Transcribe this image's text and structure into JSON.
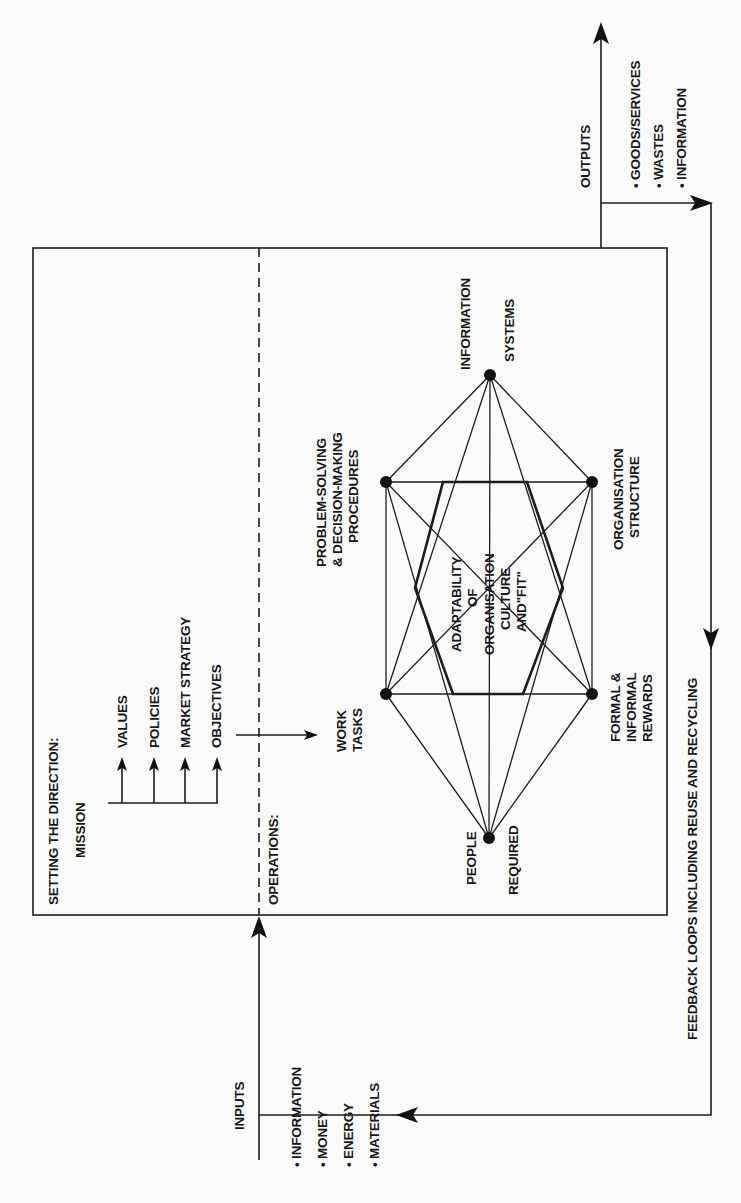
{
  "inputs": {
    "label": "INPUTS",
    "items": [
      "• INFORMATION",
      "• MONEY",
      "• ENERGY",
      "• MATERIALS"
    ]
  },
  "outputs": {
    "label": "OUTPUTS",
    "items": [
      "• GOODS/SERVICES",
      "• WASTES",
      "• INFORMATION"
    ]
  },
  "feedback": {
    "label": "FEEDBACK LOOPS INCLUDING REUSE AND RECYCLING"
  },
  "direction": {
    "heading": "SETTING THE DIRECTION:",
    "mission": "MISSION",
    "items": [
      "VALUES",
      "POLICIES",
      "MARKET STRATEGY",
      "OBJECTIVES"
    ]
  },
  "operations": {
    "heading": "OPERATIONS:",
    "nodes": {
      "information_systems": [
        "INFORMATION",
        "SYSTEMS"
      ],
      "problem_solving": [
        "PROBLEM-SOLVING",
        "& DECISION-MAKING",
        "PROCEDURES"
      ],
      "organisation_structure": [
        "ORGANISATION",
        "STRUCTURE"
      ],
      "work_tasks": [
        "WORK",
        "TASKS"
      ],
      "formal_rewards": [
        "FORMAL &",
        "INFORMAL",
        "REWARDS"
      ],
      "people_required": [
        "PEOPLE",
        "REQUIRED"
      ]
    },
    "center": [
      "ADAPTABILITY",
      "OF",
      "ORGANISATION",
      "CULTURE",
      "AND\"FIT\""
    ]
  },
  "colors": {
    "ink": "#161616",
    "background": "#fbfbfb"
  }
}
